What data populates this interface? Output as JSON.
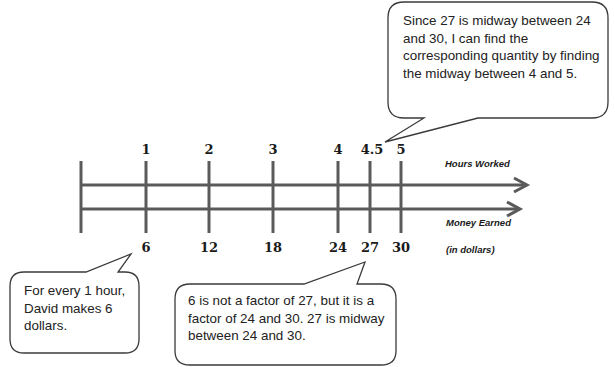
{
  "diagram": {
    "top_line": {
      "label": "Hours Worked",
      "ticks": [
        {
          "label": "1",
          "x": 146
        },
        {
          "label": "2",
          "x": 209
        },
        {
          "label": "3",
          "x": 273
        },
        {
          "label": "4",
          "x": 338
        },
        {
          "label": "4.5",
          "x": 370
        },
        {
          "label": "5",
          "x": 401
        }
      ]
    },
    "bottom_line": {
      "label": "Money Earned",
      "sublabel": "(in dollars)",
      "ticks": [
        {
          "label": "6",
          "x": 146
        },
        {
          "label": "12",
          "x": 209
        },
        {
          "label": "18",
          "x": 273
        },
        {
          "label": "24",
          "x": 338
        },
        {
          "label": "27",
          "x": 370
        },
        {
          "label": "30",
          "x": 401
        }
      ]
    },
    "callouts": {
      "top_right": "Since 27 is midway between 24 and 30, I can find the corresponding quantity by finding the midway between 4 and 5.",
      "bottom_left": "For every 1 hour, David makes 6 dollars.",
      "bottom_middle": "6 is not a factor of 27, but it is a factor of 24 and 30.  27 is midway between 24 and 30."
    },
    "colors": {
      "line": "#5a5a5a",
      "bubble_stroke": "#3a3a3a",
      "text": "#1a1a1a"
    }
  }
}
